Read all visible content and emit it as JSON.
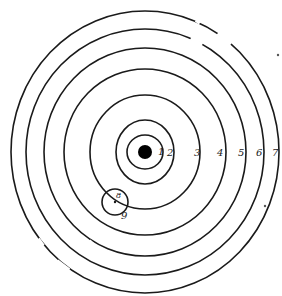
{
  "figure": {
    "center": {
      "x": 145,
      "y": 152
    },
    "center_dot": {
      "r": 7,
      "color": "#000000"
    },
    "ring_color": "#1a1a1a",
    "rings": [
      {
        "label": "1",
        "rx": 18,
        "ry": 17,
        "label_x": 158,
        "label_y": 155
      },
      {
        "label": "2",
        "rx": 29,
        "ry": 32,
        "label_x": 167,
        "label_y": 156
      },
      {
        "label": "3",
        "rx": 55,
        "ry": 57,
        "label_x": 194,
        "label_y": 156
      },
      {
        "label": "4",
        "rx": 81,
        "ry": 83,
        "label_x": 217,
        "label_y": 156
      },
      {
        "label": "5",
        "rx": 101,
        "ry": 104,
        "label_x": 238,
        "label_y": 156
      },
      {
        "label": "6",
        "rx": 119,
        "ry": 123,
        "label_x": 256,
        "label_y": 156
      },
      {
        "label": "7",
        "rx": 134,
        "ry": 141,
        "label_x": 272,
        "label_y": 156
      }
    ],
    "small_circle": {
      "cx": 115,
      "cy": 202,
      "r": 13,
      "label_inner": "8",
      "label_outer": "9"
    },
    "stray_dots": [
      {
        "x": 278,
        "y": 55
      },
      {
        "x": 265,
        "y": 206
      }
    ]
  }
}
